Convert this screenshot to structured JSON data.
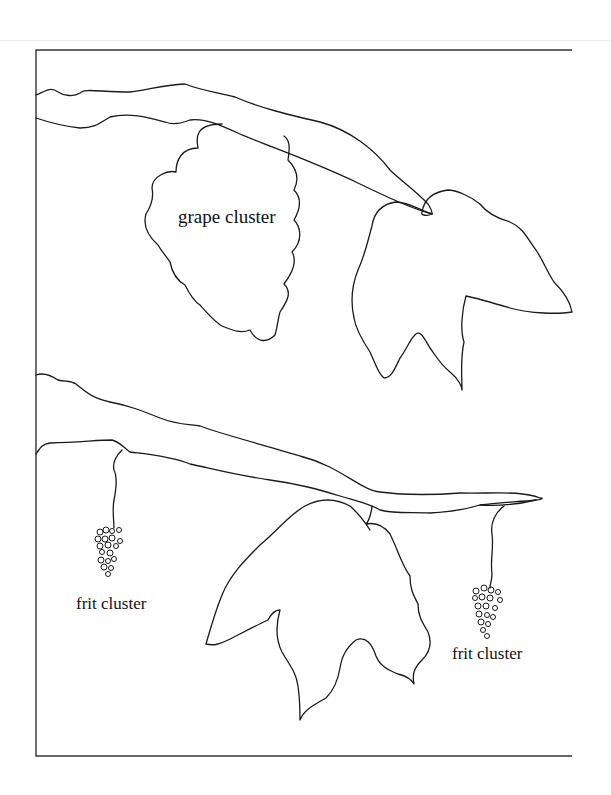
{
  "diagram": {
    "labels": {
      "grape_cluster": "grape cluster",
      "frit_cluster_left": "frit cluster",
      "frit_cluster_right": "frit cluster"
    },
    "elements": [
      "upper-vine-branch",
      "upper-grape-leaf",
      "grape-cluster-outline",
      "lower-vine-branch",
      "lower-grape-leaf",
      "frit-cluster-left",
      "frit-cluster-right"
    ],
    "colors": {
      "line": "#1a1a1a",
      "frame": "#333333",
      "background": "#ffffff"
    }
  }
}
